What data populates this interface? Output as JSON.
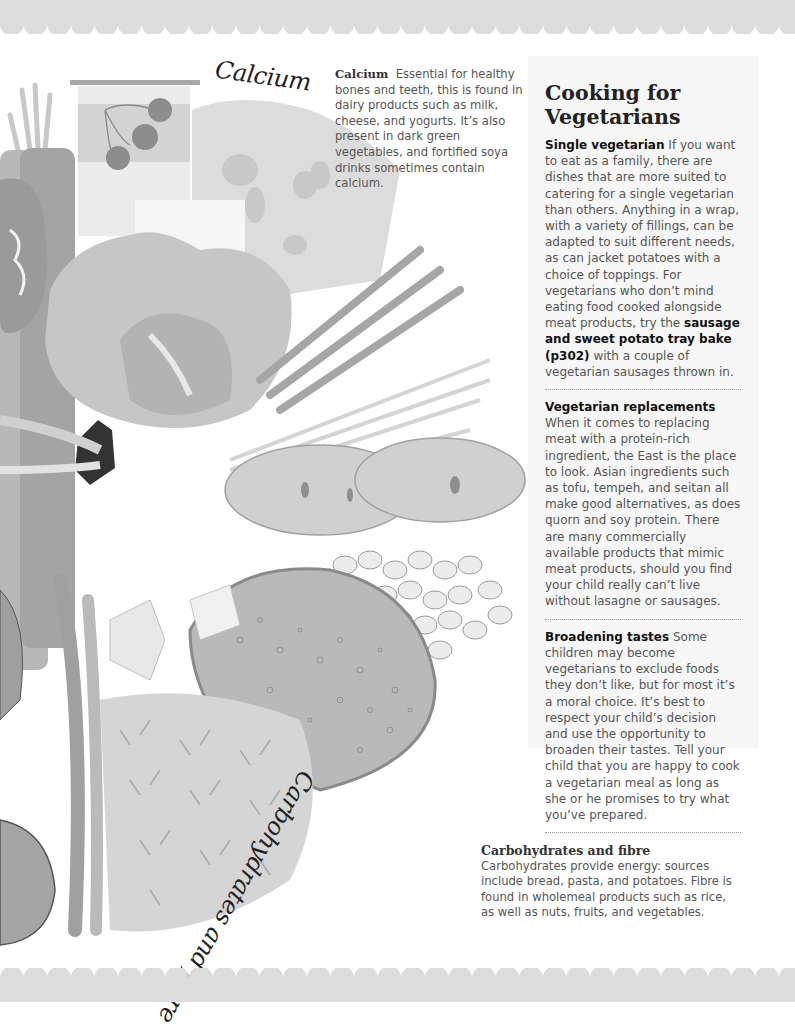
{
  "page": {
    "title": "Cooking for Vegetarians",
    "colors": {
      "scallop_band": "#dcdcdc",
      "panel_bg": "#f7f7f7",
      "body_text": "#555555",
      "heading_text": "#222222",
      "divider": "#999999"
    }
  },
  "illustration": {
    "handwritten_labels": {
      "calcium": "Calcium",
      "carbs": "Carbohydrates and fibre"
    }
  },
  "captions": {
    "calcium": {
      "title": "Calcium",
      "text": "Essential for healthy bones and teeth, this is found in dairy products such as milk, cheese, and yogurts. It’s also present in dark green vegetables, and fortified soya drinks sometimes contain calcium."
    },
    "carbs": {
      "title": "Carbohydrates and fibre",
      "text": "Carbohydrates provide energy: sources include bread, pasta, and potatoes. Fibre is found in wholemeal products such as rice, as well as nuts, fruits, and vegetables."
    }
  },
  "panel": {
    "title": "Cooking for Vegetarians",
    "sections": [
      {
        "lead": "Single vegetarian",
        "text_before": "If you want to eat as a family, there are dishes that are more suited to catering for a single vegetarian than others. Anything in a wrap, with a variety of fillings, can be adapted to suit different needs, as can jacket potatoes with a choice of toppings. For vegetarians who don’t mind eating food cooked alongside meat products, try the",
        "link": "sausage and sweet potato tray bake (p302)",
        "text_after": "with a couple of vegetarian sausages thrown in."
      },
      {
        "lead": "Vegetarian replacements",
        "text_before": "When it comes to replacing meat with a protein-rich ingredient, the East is the place to look. Asian ingredients such as tofu, tempeh, and seitan all make good alternatives, as does quorn and soy protein. There are many commercially available products that mimic meat products, should you find your child really can’t live without lasagne or sausages."
      },
      {
        "lead": "Broadening tastes",
        "text_before": "Some children may become vegetarians to exclude foods they don’t like, but for most it’s a moral choice. It’s best to respect your child’s decision and use the opportunity to broaden their tastes. Tell your child that you are happy to cook a vegetarian meal as long as she or he promises to try what you’ve prepared."
      }
    ]
  }
}
